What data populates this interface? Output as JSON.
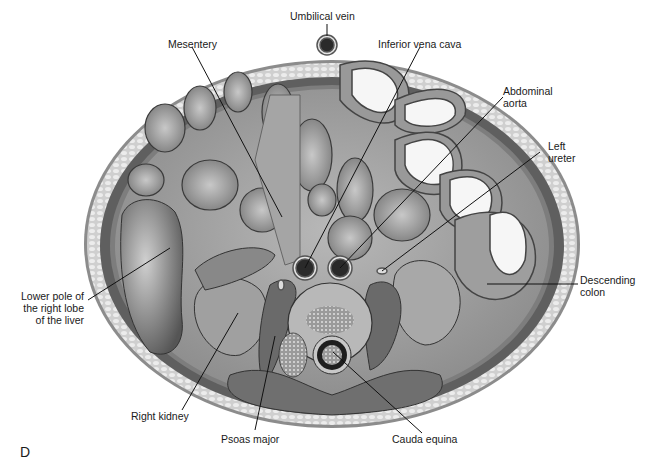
{
  "figure": {
    "panel_letter": "D",
    "colors": {
      "background": "#ffffff",
      "skin_fat": "#d8d8d8",
      "muscle_wall": "#6e6e6e",
      "cavity": "#a9a9a9",
      "vessel_dark": "#2a2a2a",
      "bowel_lumen_light": "#f4f4f4",
      "leader_line": "#111111"
    }
  },
  "labels": {
    "umbilical_vein": "Umbilical vein",
    "mesentery": "Mesentery",
    "inferior_vena_cava": "Inferior vena cava",
    "abdominal_aorta": "Abdominal\naorta",
    "left_ureter": "Left\nureter",
    "descending_colon": "Descending\ncolon",
    "liver": "Lower pole of\nthe right lobe\nof the liver",
    "right_kidney": "Right kidney",
    "psoas_major": "Psoas major",
    "cauda_equina": "Cauda equina"
  }
}
